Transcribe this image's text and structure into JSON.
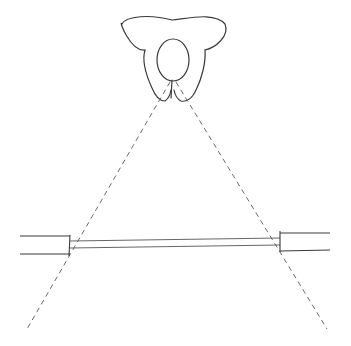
{
  "diagram": {
    "type": "hand-drawn line sketch",
    "colors": {
      "background": "#ffffff",
      "stroke": "#3a3a3a",
      "dashed_stroke": "#6a6a6a"
    },
    "elements": [
      {
        "id": "person",
        "label": "person-top-view",
        "parts": [
          "shoulders",
          "head",
          "arms"
        ]
      },
      {
        "id": "wall-left",
        "label": "wall-segment-left"
      },
      {
        "id": "window",
        "label": "window-glass"
      },
      {
        "id": "wall-right",
        "label": "wall-segment-right"
      },
      {
        "id": "sightline-left",
        "label": "dashed-sight-line-left",
        "style": "dashed"
      },
      {
        "id": "sightline-right",
        "label": "dashed-sight-line-right",
        "style": "dashed"
      }
    ],
    "text_labels": []
  }
}
